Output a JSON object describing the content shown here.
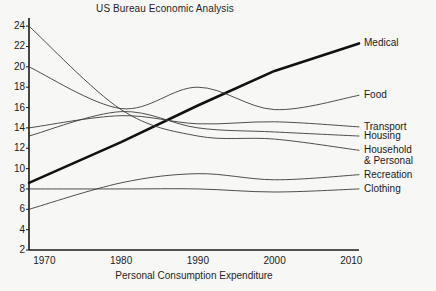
{
  "chart_data": {
    "type": "line",
    "title": "US Bureau Economic Analysis",
    "xlabel": "Personal Consumption Expenditure",
    "ylabel": "",
    "xlim": [
      1968,
      2011
    ],
    "ylim": [
      2,
      24.8
    ],
    "grid": false,
    "legend_position": "right-of-plot-inline-labels",
    "x_ticks": [
      "1970",
      "1980",
      "1990",
      "2000",
      "2010"
    ],
    "x_tick_values": [
      1970,
      1980,
      1990,
      2000,
      2010
    ],
    "y_ticks": [
      "2",
      "4",
      "6",
      "8",
      "10",
      "12",
      "14",
      "16",
      "18",
      "20",
      "22",
      "24"
    ],
    "y_tick_values": [
      2,
      4,
      6,
      8,
      10,
      12,
      14,
      16,
      18,
      20,
      22,
      24
    ],
    "x": [
      1968,
      1980,
      1990,
      2000,
      2011
    ],
    "series": [
      {
        "name": "Medical",
        "label": "Medical",
        "color": "#111111",
        "width": 2.6,
        "values": [
          8.6,
          12.6,
          16.2,
          19.6,
          22.3
        ]
      },
      {
        "name": "Food",
        "label": "Food",
        "color": "#3a3a3a",
        "width": 0.9,
        "values": [
          20.0,
          15.9,
          18.0,
          15.8,
          17.2
        ]
      },
      {
        "name": "Transport",
        "label": "Transport",
        "color": "#3a3a3a",
        "width": 0.9,
        "values": [
          14.0,
          15.2,
          14.4,
          14.6,
          14.1
        ]
      },
      {
        "name": "Housing",
        "label": "Housing",
        "color": "#3a3a3a",
        "width": 0.9,
        "values": [
          13.2,
          15.6,
          14.0,
          13.6,
          13.2
        ]
      },
      {
        "name": "Household & Personal",
        "label": "Household",
        "label_line2": "& Personal",
        "color": "#3a3a3a",
        "width": 0.9,
        "values": [
          24.0,
          15.8,
          13.2,
          12.9,
          11.8
        ]
      },
      {
        "name": "Recreation",
        "label": "Recreation",
        "color": "#3a3a3a",
        "width": 0.9,
        "values": [
          6.0,
          8.6,
          9.5,
          8.9,
          9.4
        ]
      },
      {
        "name": "Clothing",
        "label": "Clothing",
        "color": "#3a3a3a",
        "width": 0.9,
        "values": [
          8.0,
          8.0,
          8.0,
          7.7,
          8.0
        ]
      }
    ]
  },
  "axes": {
    "left_px": 29,
    "right_px": 359,
    "top_px": 18,
    "bottom_px": 250
  }
}
